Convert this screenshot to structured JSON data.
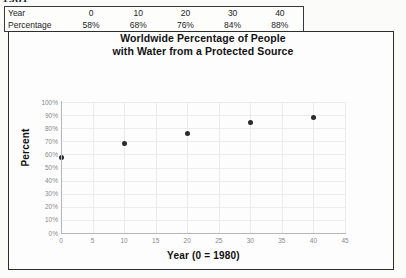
{
  "page": {
    "top_partial_text": "1981"
  },
  "table": {
    "rows": [
      {
        "label": "Year",
        "values": [
          "0",
          "10",
          "20",
          "30",
          "40"
        ]
      },
      {
        "label": "Percentage",
        "values": [
          "58%",
          "68%",
          "76%",
          "84%",
          "88%"
        ]
      }
    ]
  },
  "chart_data": {
    "type": "scatter",
    "title": "Worldwide Percentage of People with Water from a Protected Source",
    "title_line1": "Worldwide Percentage of People",
    "title_line2": "with Water from a Protected Source",
    "xlabel": "Year (0 = 1980)",
    "ylabel": "Percent",
    "x": [
      0,
      10,
      20,
      30,
      40
    ],
    "values": [
      58,
      68,
      76,
      84,
      88
    ],
    "xlim": [
      0,
      45
    ],
    "ylim": [
      0,
      100
    ],
    "xticks": [
      "0",
      "5",
      "10",
      "15",
      "20",
      "25",
      "30",
      "35",
      "40",
      "45"
    ],
    "yticks": [
      "100%",
      "90%",
      "80%",
      "70%",
      "60%",
      "50%",
      "40%",
      "30%",
      "20%",
      "10%",
      "0%"
    ],
    "grid": true,
    "legend": "none",
    "marker_color": "#2b2b2b",
    "grid_color": "#eceaea",
    "axis_color": "#b6b6b6"
  }
}
